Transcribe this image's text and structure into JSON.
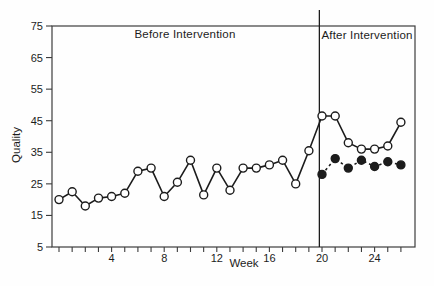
{
  "chart_data": {
    "type": "line",
    "title": "",
    "xlabel": "Week",
    "ylabel": "Quality",
    "before_label": "Before Intervention",
    "after_label": "After Intervention",
    "x_range": [
      0,
      26
    ],
    "x_tick_interval": 1,
    "x_tick_labels": [
      4,
      8,
      12,
      16,
      20,
      24
    ],
    "ylim": [
      5,
      75
    ],
    "y_ticks": [
      75,
      65,
      55,
      45,
      35,
      25,
      15,
      5
    ],
    "grid": false,
    "legend": "none",
    "intervention_line_week": 19.8,
    "series": [
      {
        "name": "Quality (open circles, solid line)",
        "marker": "open-circle",
        "line_style": "solid",
        "x_start_week": 0,
        "values": [
          20,
          22.5,
          18,
          20.5,
          21,
          22,
          29,
          30,
          21,
          25.5,
          32.5,
          21.5,
          30,
          23,
          30,
          30,
          31,
          32.5,
          25,
          35.5,
          46.5,
          46.5,
          38,
          36,
          36,
          37,
          44.5
        ]
      },
      {
        "name": "Comparison (filled circles, dotted line)",
        "marker": "filled-circle",
        "line_style": "dotted",
        "x_start_week": 20,
        "values": [
          28,
          33,
          30,
          32.5,
          30.5,
          32,
          31
        ]
      }
    ],
    "colors": {
      "ink": "#1c1c1c",
      "frame": "#3c3c3c",
      "marker_fill_open": "#ffffff"
    }
  }
}
